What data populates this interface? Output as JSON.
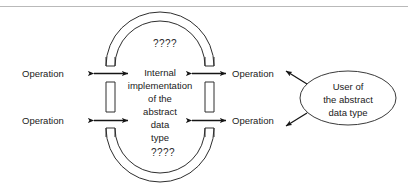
{
  "diagram": {
    "capsule": {
      "inner_label_lines": [
        "Internal",
        "implementation",
        "of the",
        "abstract",
        "data",
        "type"
      ],
      "hidden_marker_top": "????",
      "hidden_marker_bottom": "????"
    },
    "operations": [
      {
        "label": "Operation",
        "side": "left",
        "position": "upper"
      },
      {
        "label": "Operation",
        "side": "left",
        "position": "lower"
      },
      {
        "label": "Operation",
        "side": "right",
        "position": "upper"
      },
      {
        "label": "Operation",
        "side": "right",
        "position": "lower"
      }
    ],
    "user_bubble": {
      "lines": [
        "User of",
        "the abstract",
        "data type"
      ]
    },
    "colors": {
      "stroke": "#2e2e2e",
      "arrow": "#151515",
      "text": "#1a1a1a",
      "rule": "#b9b9b9",
      "background": "#ffffff"
    }
  }
}
